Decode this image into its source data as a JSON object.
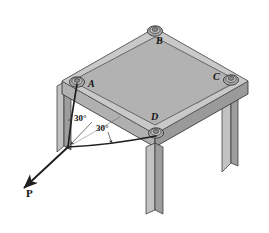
{
  "figure": {
    "type": "engineering-statics-diagram",
    "background_color": "#ffffff"
  },
  "labels": {
    "point_a": "A",
    "point_b": "B",
    "point_c": "C",
    "point_d": "D",
    "angle_1": "30°",
    "angle_2": "30°",
    "force": "P"
  },
  "label_positions": {
    "point_a": {
      "x": 88,
      "y": 84
    },
    "point_b": {
      "x": 156,
      "y": 41
    },
    "point_c": {
      "x": 215,
      "y": 77
    },
    "point_d": {
      "x": 152,
      "y": 116
    },
    "angle_1": {
      "x": 75,
      "y": 117
    },
    "angle_2": {
      "x": 98,
      "y": 128
    },
    "force": {
      "x": 28,
      "y": 177
    }
  },
  "geometry": {
    "table_top": {
      "corner_left": {
        "x": 62,
        "y": 81
      },
      "corner_top": {
        "x": 155,
        "y": 28
      },
      "corner_right": {
        "x": 248,
        "y": 81
      },
      "corner_front": {
        "x": 155,
        "y": 134
      },
      "thickness_px": 13
    },
    "rings": [
      {
        "id": "A",
        "x": 77,
        "y": 82,
        "rx": 7.5,
        "ry": 5
      },
      {
        "id": "B",
        "x": 155,
        "y": 31,
        "rx": 7.5,
        "ry": 5
      },
      {
        "id": "C",
        "x": 231,
        "y": 80,
        "rx": 7.5,
        "ry": 5
      },
      {
        "id": "D",
        "x": 156,
        "y": 133,
        "rx": 7.5,
        "ry": 5
      }
    ],
    "legs": [
      {
        "id": "leg-left",
        "top_x": 62,
        "top_y": 92,
        "bottom_y": 152,
        "width": 7
      },
      {
        "id": "leg-front",
        "top_x": 150,
        "top_y": 146,
        "bottom_y": 214,
        "width": 9
      },
      {
        "id": "leg-right",
        "top_x": 226,
        "top_y": 92,
        "bottom_y": 172,
        "width": 9
      }
    ],
    "cord_junction": {
      "x": 68,
      "y": 147
    },
    "cord_a_anchor": {
      "x": 77,
      "y": 84
    },
    "cord_d_anchor": {
      "x": 156,
      "y": 135
    },
    "force_arrow": {
      "from_x": 68,
      "from_y": 147,
      "to_x": 22,
      "to_y": 190
    }
  },
  "colors": {
    "top_surface": "#b5b5b5",
    "rim_band": "#c9c9c9",
    "edge_front_left": "#b0b0b0",
    "edge_front_right": "#9a9a9a",
    "leg_light": "#c2c2c2",
    "leg_dark": "#9d9d9d",
    "outline": "#2b2b2b",
    "cord": "#1f1f1f",
    "ring_outer": "#a8a8a8",
    "ring_inner": "#8c8c8c",
    "leader": "#3a3a3a"
  }
}
